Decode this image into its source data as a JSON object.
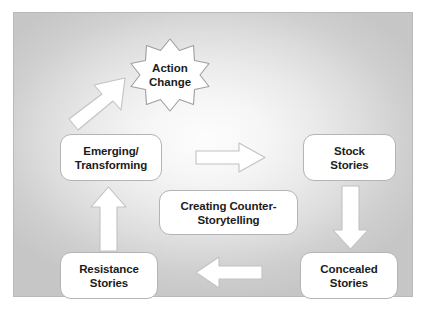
{
  "diagram": {
    "type": "cycle-diagram",
    "panel": {
      "background_edge_color": "#c6c6c6",
      "background_center_color": "#fdfdfd",
      "border_color": "#b9b9b9"
    },
    "node_style": {
      "fill": "#ffffff",
      "stroke": "#b4b4b4",
      "text_color": "#1c1c1c"
    },
    "arrow_style": {
      "fill": "#ffffff",
      "stroke": "#c0c0c0"
    },
    "nodes": [
      {
        "id": "action",
        "label": "Action\nChange",
        "line1": "Action",
        "line2": "Change",
        "shape": "star-burst"
      },
      {
        "id": "emerging",
        "label": "Emerging/\nTransforming",
        "line1": "Emerging/",
        "line2": "Transforming",
        "shape": "rounded-rect"
      },
      {
        "id": "stock",
        "label": "Stock\nStories",
        "line1": "Stock",
        "line2": "Stories",
        "shape": "rounded-rect"
      },
      {
        "id": "concealed",
        "label": "Concealed\nStories",
        "line1": "Concealed",
        "line2": "Stories",
        "shape": "rounded-rect"
      },
      {
        "id": "resistance",
        "label": "Resistance\nStories",
        "line1": "Resistance",
        "line2": "Stories",
        "shape": "rounded-rect"
      },
      {
        "id": "center",
        "label": "Creating Counter-\nStorytelling",
        "line1": "Creating Counter-",
        "line2": "Storytelling",
        "shape": "rounded-rect"
      }
    ],
    "arrows": [
      {
        "id": "arrow-right",
        "direction": "right",
        "from": "emerging",
        "to": "stock",
        "icon": "arrow-right-icon"
      },
      {
        "id": "arrow-down",
        "direction": "down",
        "from": "stock",
        "to": "concealed",
        "icon": "arrow-down-icon"
      },
      {
        "id": "arrow-left",
        "direction": "left",
        "from": "concealed",
        "to": "resistance",
        "icon": "arrow-left-icon"
      },
      {
        "id": "arrow-up",
        "direction": "up",
        "from": "resistance",
        "to": "emerging",
        "icon": "arrow-up-icon"
      },
      {
        "id": "arrow-diag",
        "direction": "up-right",
        "from": "emerging",
        "to": "action",
        "icon": "arrow-up-right-icon"
      }
    ]
  }
}
